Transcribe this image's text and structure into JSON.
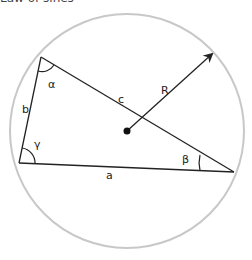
{
  "header": {
    "title_partial": "Law of sines"
  },
  "diagram": {
    "labels": {
      "alpha": "α",
      "beta": "β",
      "gamma": "γ",
      "side_a": "a",
      "side_b": "b",
      "side_c": "c",
      "radius": "R"
    },
    "colors": {
      "circle": "#c8c8c8",
      "lines": "#222222"
    }
  }
}
